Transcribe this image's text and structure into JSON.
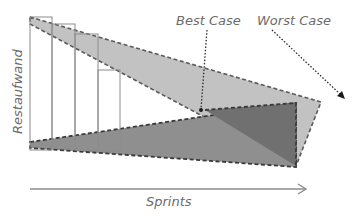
{
  "diagram": {
    "y_axis_label": "Restaufwand",
    "x_axis_label": "Sprints",
    "annotations": {
      "best_case": "Best Case",
      "worst_case": "Worst Case"
    },
    "bars": [
      {
        "x": 30,
        "top": 17,
        "bottom": 150,
        "width": 22
      },
      {
        "x": 52,
        "top": 24,
        "bottom": 148,
        "width": 23
      },
      {
        "x": 75,
        "top": 34,
        "bottom": 150,
        "width": 23
      },
      {
        "x": 98,
        "top": 70,
        "bottom": 151,
        "width": 22
      }
    ],
    "colors": {
      "worst_band": "#bdbdbd",
      "best_band": "#8a8a8a",
      "overlap": "#6e6e6e",
      "dash": "#4a4a4a",
      "bar_outline": "#8c8c8c",
      "axis": "#8c8c8c",
      "text": "#6b6b6b",
      "pointer": "#2a2a2a"
    }
  }
}
